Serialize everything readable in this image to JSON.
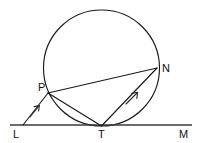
{
  "figure": {
    "type": "geometry-diagram",
    "background_color": "#ffffff",
    "stroke_color": "#1a1a1a",
    "baseline_color": "#3a3a3a"
  },
  "labels": {
    "L": "L",
    "M": "M",
    "T": "T",
    "P": "P",
    "N": "N"
  },
  "geometry": {
    "circle": {
      "cx": 101.5,
      "cy": 68,
      "r": 58
    },
    "points": {
      "L": {
        "x": 23,
        "y": 125
      },
      "M": {
        "x": 190,
        "y": 125
      },
      "T": {
        "x": 101.5,
        "y": 126
      },
      "P": {
        "x": 48,
        "y": 93
      },
      "N": {
        "x": 157,
        "y": 68
      }
    },
    "baseline": {
      "x1": 10,
      "y1": 125,
      "x2": 192,
      "y2": 125
    },
    "segments": [
      {
        "name": "L-P",
        "from": "L",
        "to": "P",
        "arrow_at": 0.55
      },
      {
        "name": "P-N",
        "from": "P",
        "to": "N",
        "arrow_at": null
      },
      {
        "name": "P-T",
        "from": "P",
        "to": "T",
        "arrow_at": null
      },
      {
        "name": "T-N",
        "from": "T",
        "to": "N",
        "arrow_at": 0.62
      }
    ],
    "label_positions": {
      "L": {
        "x": 13,
        "y": 138
      },
      "M": {
        "x": 179,
        "y": 138
      },
      "T": {
        "x": 98,
        "y": 138
      },
      "P": {
        "x": 38,
        "y": 91
      },
      "N": {
        "x": 162,
        "y": 72
      }
    }
  }
}
